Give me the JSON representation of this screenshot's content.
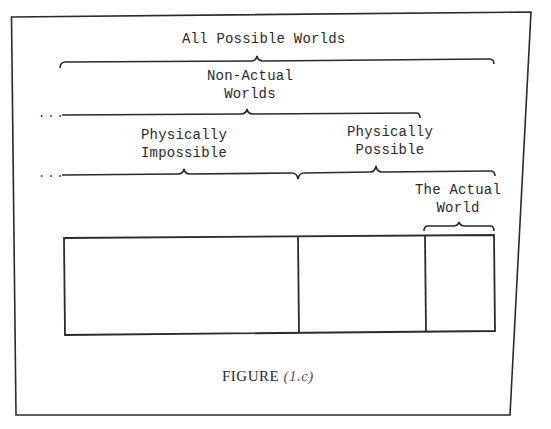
{
  "diagram": {
    "labels": {
      "all_possible_worlds": "All Possible Worlds",
      "non_actual_line1": "Non-Actual",
      "non_actual_line2": "Worlds",
      "phys_impossible_line1": "Physically",
      "phys_impossible_line2": "Impossible",
      "phys_possible_line1": "Physically",
      "phys_possible_line2": "Possible",
      "actual_world_line1": "The Actual",
      "actual_world_line2": "World",
      "ellipsis": "..."
    },
    "caption": {
      "word": "FIGURE",
      "number": "(1.c)"
    },
    "regions": [
      {
        "name": "Physically Impossible",
        "x_start": 64,
        "x_end": 298
      },
      {
        "name": "Physically Possible (non-actual)",
        "x_start": 298,
        "x_end": 425
      },
      {
        "name": "The Actual World",
        "x_start": 425,
        "x_end": 494
      }
    ],
    "colors": {
      "ink": "#2a2a2a",
      "paper": "#ffffff"
    }
  }
}
